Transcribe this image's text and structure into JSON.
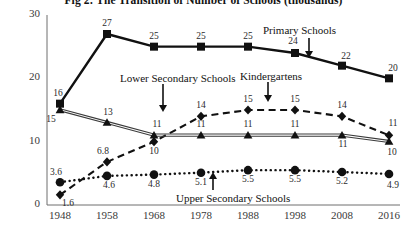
{
  "chart_data": {
    "type": "line",
    "title": "Fig 2: The Transition of Number of Schools (thousands)",
    "xlabel": "",
    "ylabel": "",
    "categories": [
      "1948",
      "1958",
      "1968",
      "1978",
      "1988",
      "1998",
      "2008",
      "2016"
    ],
    "x_tick_labels": [
      "1948",
      "1958",
      "1968",
      "1978",
      "1988",
      "1998",
      "2008",
      "2016"
    ],
    "y_tick_labels": [
      "0",
      "10",
      "20",
      "30"
    ],
    "y_ticks": [
      0,
      10,
      20,
      30
    ],
    "ylim": [
      0,
      30
    ],
    "grid": false,
    "legend_position": "inline-annotations",
    "series": [
      {
        "name": "Primary Schools",
        "marker": "square",
        "line_style": "solid",
        "values": [
          16,
          27,
          25,
          25,
          25,
          24,
          22,
          20
        ],
        "labels": [
          "16",
          "27",
          "25",
          "25",
          "25",
          "24",
          "22",
          "20"
        ]
      },
      {
        "name": "Lower Secondary Schools",
        "marker": "triangle",
        "line_style": "solid-thin-double",
        "values": [
          15,
          13,
          11,
          11,
          11,
          11,
          11,
          10
        ],
        "labels": [
          "15",
          "13",
          "11",
          "11",
          "11",
          "11",
          "11",
          "10"
        ]
      },
      {
        "name": "Kindergartens",
        "marker": "diamond",
        "line_style": "dashed",
        "values": [
          1.6,
          6.8,
          10,
          14,
          15,
          15,
          14,
          11
        ],
        "labels": [
          "1.6",
          "6.8",
          "10",
          "14",
          "15",
          "15",
          "14",
          "11"
        ]
      },
      {
        "name": "Upper Secondary Schools",
        "marker": "circle",
        "line_style": "dotted",
        "values": [
          3.6,
          4.6,
          4.8,
          5.1,
          5.5,
          5.5,
          5.2,
          4.9
        ],
        "labels": [
          "3.6",
          "4.6",
          "4.8",
          "5.1",
          "5.5",
          "5.5",
          "5.2",
          "4.9"
        ]
      }
    ],
    "annotations": [
      {
        "text": "Primary Schools",
        "points_to": "Primary Schools"
      },
      {
        "text": "Lower Secondary Schools",
        "points_to": "Lower Secondary Schools"
      },
      {
        "text": "Kindergartens",
        "points_to": "Kindergartens"
      },
      {
        "text": "Upper Secondary Schools",
        "points_to": "Upper Secondary Schools"
      }
    ]
  },
  "colors": {
    "ink": "#111111",
    "axis": "#6e6e6e",
    "label": "#2b2b2b",
    "background": "#ffffff"
  }
}
